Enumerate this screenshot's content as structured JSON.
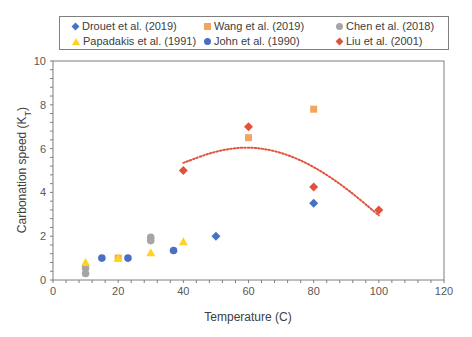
{
  "chart_data": {
    "type": "scatter",
    "title": "",
    "xlabel": "Temperature (C)",
    "ylabel": "Carbonation speed (K_T)",
    "xlim": [
      0,
      120
    ],
    "ylim": [
      0,
      10
    ],
    "x_ticks": [
      0,
      20,
      40,
      60,
      80,
      100,
      120
    ],
    "y_ticks": [
      0,
      2,
      4,
      6,
      8,
      10
    ],
    "grid": false,
    "legend_position": "top",
    "series": [
      {
        "name": "Drouet et al. (2019)",
        "marker": "diamond",
        "color": "#4472C4",
        "points": [
          [
            50,
            2.0
          ],
          [
            80,
            3.5
          ]
        ]
      },
      {
        "name": "Wang et al. (2019)",
        "marker": "square",
        "color": "#F4A460",
        "points": [
          [
            20,
            1.0
          ],
          [
            60,
            6.5
          ],
          [
            80,
            7.8
          ]
        ]
      },
      {
        "name": "Chen et al. (2018)",
        "marker": "circle",
        "color": "#A5A5A5",
        "points": [
          [
            10,
            0.3
          ],
          [
            10,
            0.55
          ],
          [
            30,
            1.8
          ],
          [
            30,
            1.95
          ]
        ]
      },
      {
        "name": "Papadakis et al. (1991)",
        "marker": "triangle",
        "color": "#FFD21F",
        "points": [
          [
            10,
            0.8
          ],
          [
            20,
            1.0
          ],
          [
            30,
            1.25
          ],
          [
            40,
            1.75
          ]
        ]
      },
      {
        "name": "John et al. (1990)",
        "marker": "circle",
        "color": "#4A6FC0",
        "points": [
          [
            15,
            1.0
          ],
          [
            23,
            1.0
          ],
          [
            37,
            1.35
          ]
        ]
      },
      {
        "name": "Liu et al. (2001)",
        "marker": "diamond",
        "color": "#E0533A",
        "points": [
          [
            40,
            5.0
          ],
          [
            60,
            7.0
          ],
          [
            80,
            4.25
          ],
          [
            100,
            3.2
          ]
        ]
      }
    ],
    "trendline": {
      "series": "Liu et al. (2001)",
      "type": "polynomial-2",
      "style": "dotted",
      "color": "#E0533A",
      "points": [
        [
          40,
          5.35
        ],
        [
          50,
          5.9
        ],
        [
          60,
          6.1
        ],
        [
          70,
          5.85
        ],
        [
          80,
          5.2
        ],
        [
          90,
          4.2
        ],
        [
          100,
          2.95
        ]
      ]
    }
  },
  "legend": {
    "items": [
      {
        "label": "Drouet et al. (2019)",
        "icon": "diamond-marker",
        "color": "#4472C4"
      },
      {
        "label": "Wang et al. (2019)",
        "icon": "square-marker",
        "color": "#F4A460"
      },
      {
        "label": "Chen et al. (2018)",
        "icon": "circle-marker",
        "color": "#A5A5A5"
      },
      {
        "label": "Papadakis et al. (1991)",
        "icon": "triangle-marker",
        "color": "#FFD21F"
      },
      {
        "label": "John et al. (1990)",
        "icon": "circle-marker",
        "color": "#4A6FC0"
      },
      {
        "label": "Liu et al. (2001)",
        "icon": "diamond-marker",
        "color": "#E0533A"
      }
    ]
  }
}
